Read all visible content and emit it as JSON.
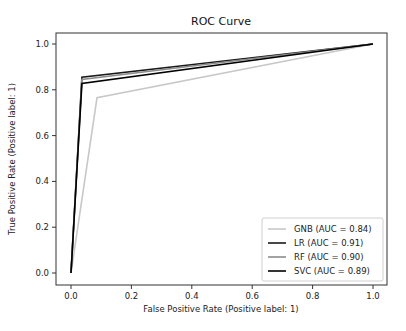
{
  "chart_data": {
    "type": "line",
    "title": "ROC Curve",
    "xlabel": "False Positive Rate (Positive label: 1)",
    "ylabel": "True Positive Rate (Positive label: 1)",
    "xlim": [
      -0.05,
      1.05
    ],
    "ylim": [
      -0.05,
      1.05
    ],
    "xticks": [
      0.0,
      0.2,
      0.4,
      0.6,
      0.8,
      1.0
    ],
    "xtick_labels": [
      "0.0",
      "0.2",
      "0.4",
      "0.6",
      "0.8",
      "1.0"
    ],
    "yticks": [
      0.0,
      0.2,
      0.4,
      0.6,
      0.8,
      1.0
    ],
    "ytick_labels": [
      "0.0",
      "0.2",
      "0.4",
      "0.6",
      "0.8",
      "1.0"
    ],
    "grid": false,
    "legend_position": "lower right",
    "series": [
      {
        "name": "GNB (AUC = 0.84)",
        "color": "#c8c8c8",
        "x": [
          0.0,
          0.086,
          1.0
        ],
        "y": [
          0.0,
          0.765,
          1.0
        ]
      },
      {
        "name": "LR (AUC = 0.91)",
        "color": "#1a1a1a",
        "x": [
          0.0,
          0.036,
          1.0
        ],
        "y": [
          0.0,
          0.855,
          1.0
        ]
      },
      {
        "name": "RF (AUC = 0.90)",
        "color": "#8c8c8c",
        "x": [
          0.0,
          0.036,
          1.0
        ],
        "y": [
          0.0,
          0.845,
          1.0
        ]
      },
      {
        "name": "SVC (AUC = 0.89)",
        "color": "#000000",
        "x": [
          0.0,
          0.036,
          1.0
        ],
        "y": [
          0.0,
          0.828,
          1.0
        ]
      }
    ]
  }
}
